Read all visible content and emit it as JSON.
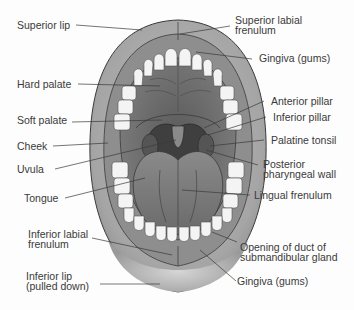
{
  "diagram": {
    "colors": {
      "background": "#fdfdfd",
      "lip": "#a9a9a9",
      "lip_highlight": "#cfcfcf",
      "gum": "#8e8e8e",
      "palate": "#6f6f6f",
      "throat": "#3f3f3f",
      "tongue": "#7d7d7d",
      "teeth": "#f2f2f2",
      "outline": "#3a3a3a",
      "label_text": "#3a3a3a",
      "leader_line": "#3a3a3a"
    },
    "labels_left": [
      {
        "id": "superior-lip",
        "text": "Superior lip"
      },
      {
        "id": "hard-palate",
        "text": "Hard palate"
      },
      {
        "id": "soft-palate",
        "text": "Soft palate"
      },
      {
        "id": "cheek",
        "text": "Cheek"
      },
      {
        "id": "uvula",
        "text": "Uvula"
      },
      {
        "id": "tongue",
        "text": "Tongue"
      },
      {
        "id": "inferior-labial-frenulum",
        "text": "Inferior labial\nfrenulum"
      },
      {
        "id": "inferior-lip",
        "text": "Inferior lip\n(pulled down)"
      }
    ],
    "labels_right": [
      {
        "id": "superior-labial-frenulum",
        "text": "Superior labial\nfrenulum"
      },
      {
        "id": "gingiva-upper",
        "text": "Gingiva (gums)"
      },
      {
        "id": "anterior-pillar",
        "text": "Anterior pillar"
      },
      {
        "id": "inferior-pillar",
        "text": "Inferior pillar"
      },
      {
        "id": "palatine-tonsil",
        "text": "Palatine tonsil"
      },
      {
        "id": "posterior-pharyngeal-wall",
        "text": "Posterior\npharyngeal wall"
      },
      {
        "id": "lingual-frenulum",
        "text": "Lingual frenulum"
      },
      {
        "id": "opening-submandibular-duct",
        "text": "Opening of duct of\nsubmandibular gland"
      },
      {
        "id": "gingiva-lower",
        "text": "Gingiva (gums)"
      }
    ]
  }
}
